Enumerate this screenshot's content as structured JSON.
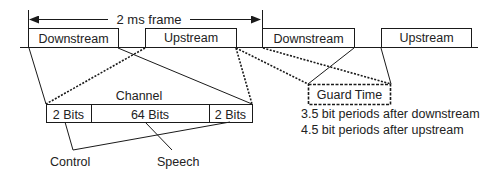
{
  "frame": {
    "label": "2 ms frame"
  },
  "timeline": {
    "slots": [
      {
        "label": "Downstream",
        "x": 28,
        "w": 90
      },
      {
        "label": "Upstream",
        "x": 145,
        "w": 91
      },
      {
        "label": "Downstream",
        "x": 262,
        "w": 92
      },
      {
        "label": "Upstream",
        "x": 381,
        "w": 90
      }
    ]
  },
  "channel": {
    "title": "Channel",
    "fields": [
      {
        "label": "2 Bits"
      },
      {
        "label": "64 Bits"
      },
      {
        "label": "2 Bits"
      }
    ]
  },
  "guard": {
    "label": "Guard Time",
    "notes": [
      "3.5 bit periods after downstream",
      "4.5 bit periods after upstream"
    ]
  },
  "callouts": {
    "control": "Control",
    "speech": "Speech"
  },
  "colors": {
    "line": "#1a1a1a",
    "text": "#222222",
    "background": "#ffffff"
  }
}
